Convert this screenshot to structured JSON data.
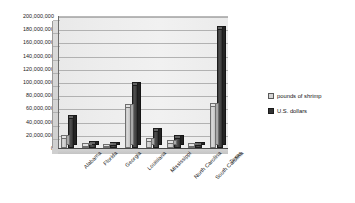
{
  "chart_data": {
    "type": "bar",
    "title": "",
    "subtitle": "",
    "xlabel": "",
    "ylabel": "",
    "grid": true,
    "legend_position": "right",
    "ylim": [
      0,
      200000000
    ],
    "ytick_step": 20000000,
    "categories": [
      "Alabama",
      "Florida",
      "Georgia",
      "Louisiana",
      "Mississippi",
      "North Carolina",
      "South Carolina",
      "Texas"
    ],
    "ytick_labels": [
      "0",
      "20,000,000",
      "40,000,000",
      "60,000,000",
      "80,000,000",
      "100,000,000",
      "120,000,000",
      "140,000,000",
      "160,000,000",
      "180,000,000",
      "200,000,000"
    ],
    "series": [
      {
        "name": "pounds of shrimp",
        "color": "#d4d4d4",
        "values": [
          15000000,
          3000000,
          1500000,
          62000000,
          10000000,
          7000000,
          2500000,
          63000000
        ]
      },
      {
        "name": "U.S. dollars",
        "color": "#333333",
        "values": [
          45000000,
          6000000,
          4000000,
          95000000,
          26000000,
          15000000,
          5000000,
          180000000
        ]
      }
    ]
  },
  "legend": {
    "items": [
      {
        "label": "pounds of shrimp",
        "swatch": "light"
      },
      {
        "label": "U.S. dollars",
        "swatch": "dark"
      }
    ]
  }
}
